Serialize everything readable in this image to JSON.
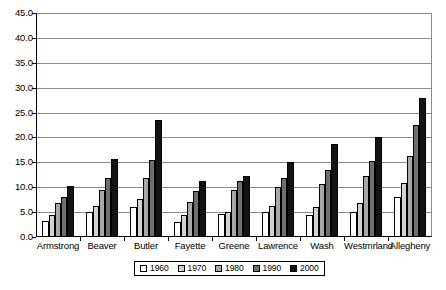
{
  "chart_data": {
    "type": "bar",
    "title": "",
    "subtitle": "",
    "xlabel": "",
    "ylabel": "",
    "ylim": [
      0.0,
      45.0
    ],
    "ytick_step": 5.0,
    "ytick_labels": [
      "0.0",
      "5.0",
      "10.0",
      "15.0",
      "20.0",
      "25.0",
      "30.0",
      "35.0",
      "40.0",
      "45.0"
    ],
    "grid": "horizontal",
    "legend_position": "bottom-center",
    "categories": [
      "Armstrong",
      "Beaver",
      "Butler",
      "Fayette",
      "Greene",
      "Lawrence",
      "Wash",
      "Westmrland",
      "Allegheny"
    ],
    "series": [
      {
        "name": "1960",
        "color": "#ffffff",
        "values": [
          3.3,
          5.0,
          6.1,
          3.1,
          4.6,
          5.0,
          4.4,
          5.1,
          8.1
        ]
      },
      {
        "name": "1970",
        "color": "#d2d2d2",
        "values": [
          4.5,
          6.2,
          7.6,
          4.5,
          5.1,
          6.2,
          6.1,
          6.9,
          10.9
        ]
      },
      {
        "name": "1980",
        "color": "#a8a8a8",
        "values": [
          6.8,
          9.4,
          11.8,
          7.1,
          9.5,
          10.0,
          10.6,
          12.2,
          16.3
        ]
      },
      {
        "name": "1990",
        "color": "#6e6e6e",
        "values": [
          8.0,
          11.9,
          15.5,
          9.3,
          11.2,
          11.8,
          13.5,
          15.2,
          22.6
        ]
      },
      {
        "name": "2000",
        "color": "#141414",
        "values": [
          10.3,
          15.6,
          23.5,
          11.3,
          12.2,
          15.0,
          18.7,
          20.1,
          28.0
        ]
      }
    ]
  },
  "legend": {
    "entries": [
      "1960",
      "1970",
      "1980",
      "1990",
      "2000"
    ]
  },
  "colors": {
    "axis": "#000000",
    "gridline": "#8c8c8c",
    "background": "#ffffff",
    "bar_outline": "#000000"
  }
}
